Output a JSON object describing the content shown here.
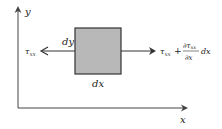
{
  "diagram": {
    "axes": {
      "x_label": "x",
      "y_label": "y"
    },
    "element": {
      "width_label": "dx",
      "height_label": "dy",
      "fill_color": "#b8b8b8",
      "stroke_color": "#333333"
    },
    "forces": {
      "left": {
        "symbol": "τ",
        "subscript": "xx"
      },
      "right": {
        "symbol": "τ",
        "subscript": "xx",
        "plus": "+",
        "numerator_partial": "∂τ",
        "numerator_subscript": "xx",
        "denominator": "∂x",
        "tail": "dx"
      }
    }
  }
}
